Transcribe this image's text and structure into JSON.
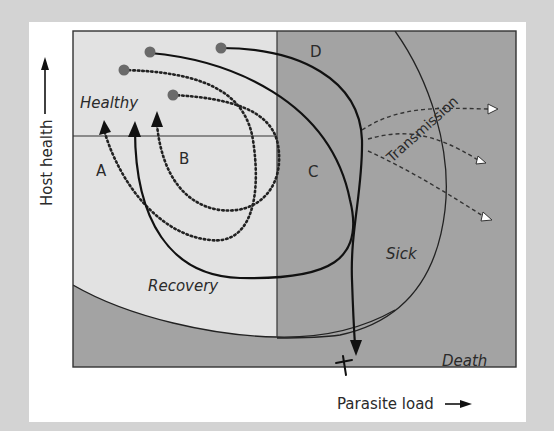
{
  "figure": {
    "axes": {
      "y_label": "Host health",
      "x_label": "Parasite load"
    },
    "regions": {
      "healthy": "Healthy",
      "recovery": "Recovery",
      "sick": "Sick",
      "death": "Death",
      "transmission": "Transmission"
    },
    "trajectory_labels": {
      "a": "A",
      "b": "B",
      "c": "C",
      "d": "D"
    },
    "death_marker": "✝",
    "colors": {
      "background": "#d3d3d3",
      "card": "#ffffff",
      "healthy_recovery_zone": "#e2e2e2",
      "sick_death_zone": "#a3a3a3",
      "lines": "#111111",
      "start_dot": "#6a6a6a"
    },
    "icons": {
      "y_arrow": "arrow-up-icon",
      "x_arrow": "arrow-right-icon",
      "start_point": "dot-icon",
      "recovery_arrowhead": "triangle-arrow-icon",
      "transmission_arrowhead": "hollow-triangle-icon",
      "death": "cross-icon"
    }
  }
}
